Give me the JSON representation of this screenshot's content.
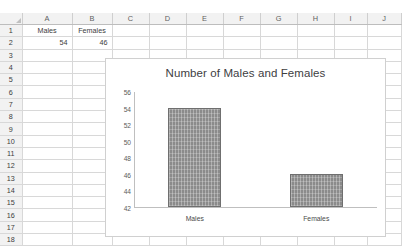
{
  "spreadsheet": {
    "column_headers": [
      "A",
      "B",
      "C",
      "D",
      "E",
      "F",
      "G",
      "H",
      "I",
      "J"
    ],
    "row_headers": [
      "1",
      "2",
      "3",
      "4",
      "5",
      "6",
      "7",
      "8",
      "9",
      "10",
      "11",
      "12",
      "13",
      "14",
      "15",
      "16",
      "17",
      "18"
    ],
    "cells": {
      "A1": "Males",
      "B1": "Females",
      "A2": "54",
      "B2": "46"
    },
    "select_all_icon": "select-all-triangle-icon"
  },
  "chart_data": {
    "type": "bar",
    "title": "Number of Males and Females",
    "categories": [
      "Males",
      "Females"
    ],
    "values": [
      54,
      46
    ],
    "xlabel": "",
    "ylabel": "",
    "ylim": [
      42,
      56
    ],
    "ytick_step": 2,
    "yticks": [
      "56",
      "54",
      "52",
      "50",
      "48",
      "46",
      "44",
      "42"
    ],
    "grid": false,
    "legend": false,
    "series_color": "#8b8b8b"
  }
}
